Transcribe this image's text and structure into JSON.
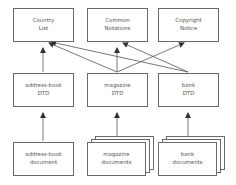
{
  "top_row": [
    {
      "line1": "Country",
      "line2": "List"
    },
    {
      "line1": "Common",
      "line2": "Notations"
    },
    {
      "line1": "Copyright",
      "line2": "Notice"
    }
  ],
  "middle_row": [
    {
      "line1": "address-book",
      "line2": "DTD"
    },
    {
      "line1": "magazine",
      "line2": "DTD"
    },
    {
      "line1": "bank",
      "line2": "DTD"
    }
  ],
  "bottom_row": [
    {
      "line1": "address-book",
      "line2": "document",
      "stacked": false
    },
    {
      "line1": "magazine",
      "line2": "documents",
      "stacked": true
    },
    {
      "line1": "bank",
      "line2": "documents",
      "stacked": true
    }
  ],
  "colors": {
    "stroke": "#6a6a6a",
    "text": "#555555",
    "background": "#ffffff"
  }
}
